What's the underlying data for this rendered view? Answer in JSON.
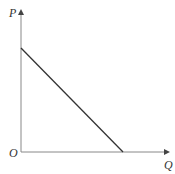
{
  "diagram": {
    "type": "demand-curve",
    "labels": {
      "y_axis": "P",
      "x_axis": "Q",
      "origin": "O"
    },
    "curve": {
      "description": "downward-sloping straight line from P-axis intercept to Q-axis intercept",
      "color": "#333333"
    },
    "axis_color": "#777777"
  }
}
